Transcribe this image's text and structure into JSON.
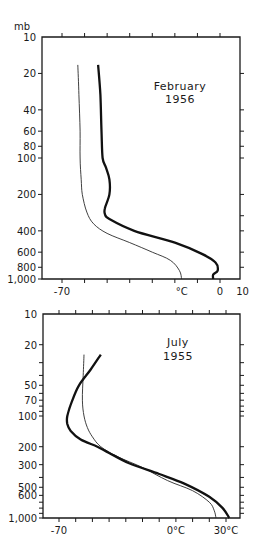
{
  "chart_data": [
    {
      "type": "line",
      "title": "February 1956",
      "title_lines": [
        "February",
        "1956"
      ],
      "ylabel": "mb",
      "xlabel": "°C",
      "yscale": "log",
      "yinvert": true,
      "ylim": [
        10,
        1000
      ],
      "xlim": [
        -77,
        10
      ],
      "ytick_labels": [
        {
          "value": 10,
          "label": "10"
        },
        {
          "value": 20,
          "label": "20"
        },
        {
          "value": 40,
          "label": "40"
        },
        {
          "value": 60,
          "label": "60"
        },
        {
          "value": 80,
          "label": "80"
        },
        {
          "value": 100,
          "label": "100"
        },
        {
          "value": 200,
          "label": "200"
        },
        {
          "value": 400,
          "label": "400"
        },
        {
          "value": 600,
          "label": "600"
        },
        {
          "value": 800,
          "label": "800"
        },
        {
          "value": 1000,
          "label": "1,000"
        }
      ],
      "xtick_values": [
        -70,
        -60,
        -50,
        -40,
        -30,
        -20,
        -10,
        0
      ],
      "xtick_labels": [
        {
          "value": -70,
          "label": "-70"
        },
        {
          "value": -17,
          "label": "°C"
        },
        {
          "value": 0,
          "label": "0"
        },
        {
          "value": 10,
          "label": "10"
        }
      ],
      "series": [
        {
          "name": "thin",
          "style": "thin",
          "points": [
            [
              -63,
              17
            ],
            [
              -62.5,
              30
            ],
            [
              -62,
              60
            ],
            [
              -62,
              100
            ],
            [
              -61.5,
              150
            ],
            [
              -61,
              200
            ],
            [
              -59,
              280
            ],
            [
              -56,
              350
            ],
            [
              -50,
              420
            ],
            [
              -40,
              500
            ],
            [
              -30,
              600
            ],
            [
              -22,
              700
            ],
            [
              -18,
              850
            ],
            [
              -17,
              1000
            ]
          ]
        },
        {
          "name": "thick",
          "style": "thick",
          "points": [
            [
              -54,
              17
            ],
            [
              -53,
              30
            ],
            [
              -52.5,
              60
            ],
            [
              -52,
              100
            ],
            [
              -50.5,
              120
            ],
            [
              -49,
              150
            ],
            [
              -49,
              200
            ],
            [
              -51,
              260
            ],
            [
              -51,
              290
            ],
            [
              -49,
              320
            ],
            [
              -38,
              400
            ],
            [
              -20,
              500
            ],
            [
              -8,
              620
            ],
            [
              -2,
              730
            ],
            [
              -1,
              850
            ],
            [
              -3,
              920
            ],
            [
              -3,
              1000
            ]
          ]
        }
      ],
      "grid": false
    },
    {
      "type": "line",
      "title": "July 1955",
      "title_lines": [
        "July",
        "1955"
      ],
      "ylabel": "mb",
      "xlabel": "°C",
      "yscale": "log",
      "yinvert": true,
      "ylim": [
        10,
        1000
      ],
      "xlim": [
        -79,
        38
      ],
      "ytick_labels": [
        {
          "value": 10,
          "label": "10"
        },
        {
          "value": 20,
          "label": "20"
        },
        {
          "value": 50,
          "label": "50"
        },
        {
          "value": 70,
          "label": "70"
        },
        {
          "value": 100,
          "label": "100"
        },
        {
          "value": 200,
          "label": "200"
        },
        {
          "value": 300,
          "label": "300"
        },
        {
          "value": 500,
          "label": "500"
        },
        {
          "value": 600,
          "label": "600"
        },
        {
          "value": 1000,
          "label": "1,000"
        }
      ],
      "xtick_values": [
        -70,
        -60,
        -50,
        -40,
        -30,
        -20,
        -10,
        0,
        10,
        20,
        30
      ],
      "xtick_labels": [
        {
          "value": -70,
          "label": "-70"
        },
        {
          "value": 0,
          "label": "0°C"
        },
        {
          "value": 30,
          "label": "30°C"
        }
      ],
      "series": [
        {
          "name": "thin",
          "style": "thin",
          "points": [
            [
              -55,
              25
            ],
            [
              -55.5,
              40
            ],
            [
              -56,
              70
            ],
            [
              -55,
              100
            ],
            [
              -53,
              130
            ],
            [
              -50,
              160
            ],
            [
              -45,
              200
            ],
            [
              -35,
              250
            ],
            [
              -20,
              320
            ],
            [
              -5,
              430
            ],
            [
              10,
              540
            ],
            [
              20,
              700
            ],
            [
              23,
              850
            ],
            [
              24,
              1000
            ]
          ]
        },
        {
          "name": "thick",
          "style": "thick",
          "points": [
            [
              -45,
              25
            ],
            [
              -51,
              35
            ],
            [
              -58,
              50
            ],
            [
              -62,
              70
            ],
            [
              -65,
              100
            ],
            [
              -65,
              120
            ],
            [
              -63,
              140
            ],
            [
              -57,
              170
            ],
            [
              -47,
              200
            ],
            [
              -40,
              230
            ],
            [
              -28,
              290
            ],
            [
              -10,
              370
            ],
            [
              5,
              460
            ],
            [
              20,
              620
            ],
            [
              28,
              800
            ],
            [
              32,
              1000
            ]
          ]
        }
      ],
      "grid": false
    }
  ]
}
